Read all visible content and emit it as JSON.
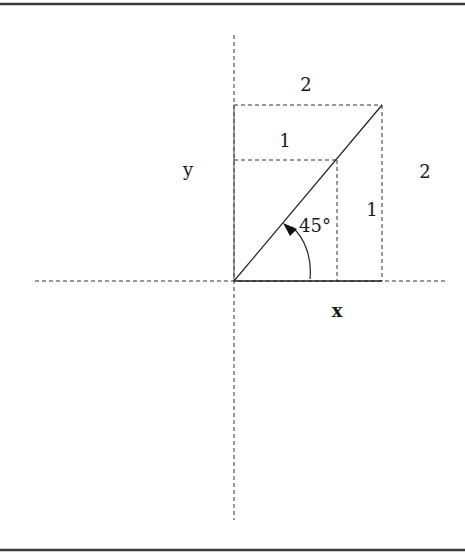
{
  "diagram": {
    "colors": {
      "line": "#222222",
      "dashed": "#333333",
      "border": "#3a3a3a",
      "background": "#ffffff"
    },
    "labels": {
      "top_width": "2",
      "inner_width": "1",
      "y_axis": "y",
      "right_height": "2",
      "inner_height": "1",
      "angle": "45°",
      "x_axis": "x"
    },
    "geometry": {
      "origin": [
        234,
        281
      ],
      "outer_corner": [
        382,
        105
      ],
      "inner_corner": [
        337,
        160
      ],
      "angle_degrees": 45,
      "outer_side": 2,
      "inner_side": 1
    }
  }
}
